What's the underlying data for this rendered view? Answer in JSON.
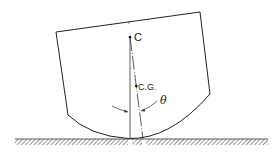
{
  "diagram": {
    "type": "rocking-body-stability",
    "labels": {
      "center_of_curvature": "C",
      "center_of_gravity": "C.G.",
      "tilt_angle": "θ"
    },
    "colors": {
      "line": "#222222",
      "hatch": "#444444",
      "background": "#ffffff"
    }
  }
}
